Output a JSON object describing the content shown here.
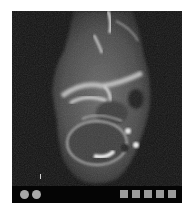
{
  "viewer": {
    "image": {
      "description": "Axial MRI slice of foot/ankle (grayscale)",
      "modality": "MRI"
    },
    "toolbar": {
      "circle_buttons": [
        {
          "name": "nav-button-1",
          "color": "#a8a8a8"
        },
        {
          "name": "nav-button-2",
          "color": "#a8a8a8"
        }
      ],
      "square_buttons": [
        {
          "name": "tool-button-1",
          "color": "#9c9c9c"
        },
        {
          "name": "tool-button-2",
          "color": "#9c9c9c"
        },
        {
          "name": "tool-button-3",
          "color": "#9c9c9c"
        },
        {
          "name": "tool-button-4",
          "color": "#9c9c9c"
        },
        {
          "name": "tool-button-5",
          "color": "#9c9c9c"
        }
      ]
    },
    "colors": {
      "background": "#0c0c0c",
      "toolbar": "#050505"
    }
  }
}
